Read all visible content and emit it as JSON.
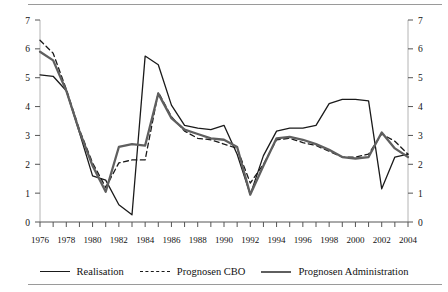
{
  "figure": {
    "top_rule": true,
    "bottom_rule": true,
    "ghost_header": "Figuur 2.1"
  },
  "legend": {
    "position": "bottom-center",
    "items": [
      {
        "label": "Realisation",
        "style": "solid-thin",
        "color": "#1a1a1a",
        "icon": "line-solid-icon"
      },
      {
        "label": "Prognosen CBO",
        "style": "dashed",
        "color": "#1a1a1a",
        "icon": "line-dashed-icon"
      },
      {
        "label": "Prognosen Administration",
        "style": "solid-thick",
        "color": "#5f5f5f",
        "icon": "line-thick-icon"
      }
    ]
  },
  "chart_data": {
    "type": "line",
    "title": "",
    "subtitle": "",
    "xlabel": "",
    "ylabel": "",
    "xlim": [
      1976,
      2004
    ],
    "ylim": [
      0,
      7
    ],
    "yticks": [
      0,
      1,
      2,
      3,
      4,
      5,
      6,
      7
    ],
    "ytick_labels": [
      "0",
      "1",
      "2",
      "3",
      "4",
      "5",
      "6",
      "7"
    ],
    "dual_y_axis": true,
    "grid": false,
    "x": [
      1976,
      1977,
      1978,
      1979,
      1980,
      1981,
      1982,
      1983,
      1984,
      1985,
      1986,
      1987,
      1988,
      1989,
      1990,
      1991,
      1992,
      1993,
      1994,
      1995,
      1996,
      1997,
      1998,
      1999,
      2000,
      2001,
      2002,
      2003,
      2004
    ],
    "xtick_labels": [
      "1976",
      "1978",
      "1980",
      "1982",
      "1984",
      "1986",
      "1988",
      "1990",
      "1992",
      "1994",
      "1996",
      "1998",
      "2000",
      "2002",
      "2004"
    ],
    "xtick_every": 2,
    "minor_tick_every": 1,
    "legend_position": "bottom",
    "series": [
      {
        "name": "Realisation",
        "style": "solid-thin",
        "color": "#1a1a1a",
        "width": 1.3,
        "values": [
          5.1,
          5.05,
          4.55,
          3.1,
          1.6,
          1.45,
          0.6,
          0.25,
          5.75,
          5.45,
          4.05,
          3.35,
          3.25,
          3.2,
          3.35,
          2.35,
          0.95,
          2.3,
          3.15,
          3.25,
          3.25,
          3.35,
          4.1,
          4.25,
          4.25,
          4.2,
          1.15,
          2.25,
          2.35
        ]
      },
      {
        "name": "Prognosen CBO",
        "style": "dashed",
        "color": "#1a1a1a",
        "width": 1.3,
        "values": [
          6.3,
          5.85,
          4.6,
          3.2,
          2.05,
          1.2,
          2.05,
          2.15,
          2.15,
          4.5,
          3.65,
          3.15,
          2.9,
          2.85,
          2.7,
          2.55,
          1.35,
          2.0,
          2.85,
          2.9,
          2.75,
          2.65,
          2.45,
          2.25,
          2.25,
          2.35,
          3.05,
          2.8,
          2.35
        ]
      },
      {
        "name": "Prognosen Administration",
        "style": "solid-thick",
        "color": "#5f5f5f",
        "width": 2.3,
        "values": [
          5.9,
          5.6,
          4.55,
          3.15,
          1.95,
          1.05,
          2.6,
          2.7,
          2.65,
          4.45,
          3.6,
          3.2,
          3.05,
          2.9,
          2.85,
          2.6,
          0.95,
          1.95,
          2.9,
          2.95,
          2.85,
          2.7,
          2.5,
          2.25,
          2.2,
          2.25,
          3.1,
          2.55,
          2.25
        ]
      }
    ]
  }
}
